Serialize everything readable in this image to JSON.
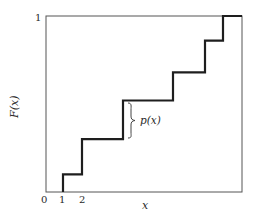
{
  "chart_data": {
    "type": "line",
    "subtype": "step-cdf",
    "title": "",
    "xlabel": "x",
    "ylabel": "F(x)",
    "x_tick_labels": [
      "0",
      "1",
      "2"
    ],
    "y_tick_labels": [
      "1"
    ],
    "annotation": "p(x)",
    "grid": false,
    "legend": null,
    "ylim": [
      0,
      1
    ],
    "steps": [
      {
        "x_px": 63,
        "F": 0.1
      },
      {
        "x_px": 82,
        "F": 0.3
      },
      {
        "x_px": 123,
        "F": 0.52
      },
      {
        "x_px": 173,
        "F": 0.68
      },
      {
        "x_px": 205,
        "F": 0.86
      },
      {
        "x_px": 223,
        "F": 1.0
      }
    ]
  },
  "labels": {
    "y_axis": "F(x)",
    "x_axis": "x",
    "y_top": "1",
    "x0": "0",
    "x1": "1",
    "x2": "2",
    "jump": "p(x)"
  },
  "colors": {
    "frame": "#555555",
    "step": "#1e1e1e",
    "text": "#2a2a2a"
  }
}
